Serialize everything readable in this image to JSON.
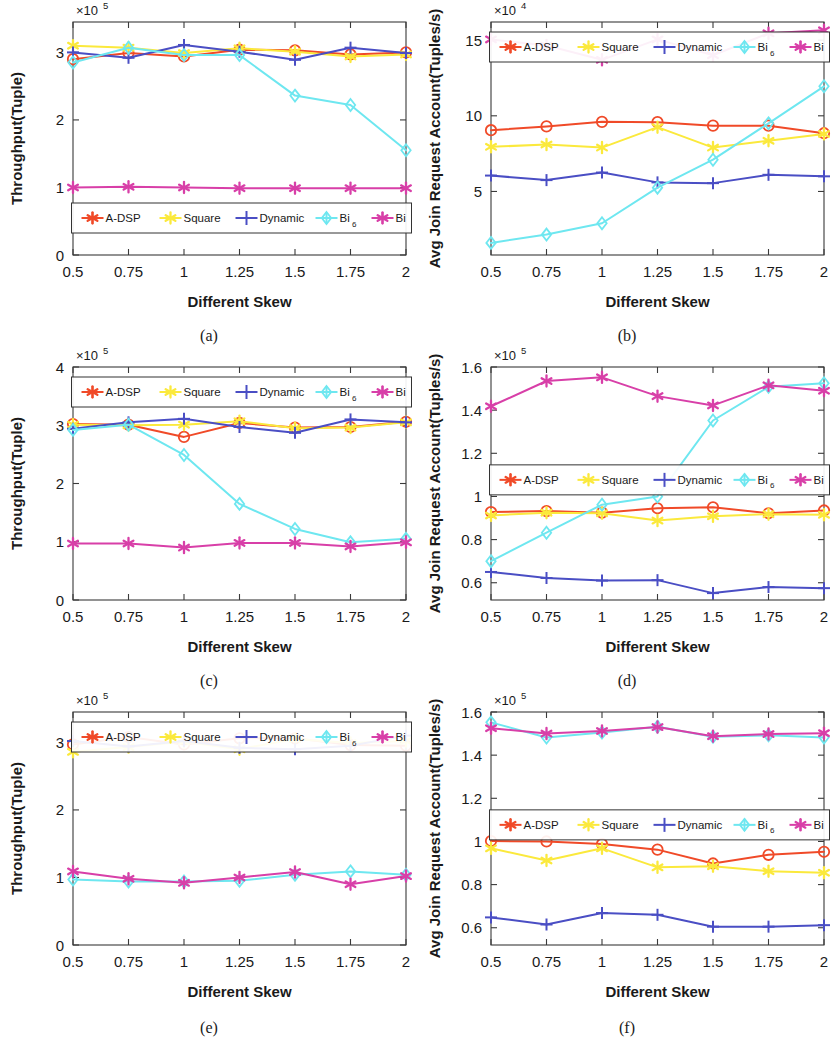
{
  "figure": {
    "xlabel": "Different  Skew",
    "categories": [
      "0.5",
      "0.75",
      "1",
      "1.25",
      "1.5",
      "1.75",
      "2"
    ],
    "series_names": [
      "A-DSP",
      "Square",
      "Dynamic",
      "Bi",
      "Bi"
    ],
    "legend_labels": [
      "A-DSP",
      "Square",
      "Dynamic",
      "Bi",
      "Bi"
    ],
    "legend_sub": "6",
    "colors": {
      "A-DSP": "#f04a28",
      "Square": "#fbe93c",
      "Dynamic": "#4a4ec4",
      "Bi6": "#6ee7f0",
      "Bi": "#d83fa8"
    },
    "captions": [
      "(a)",
      "(b)",
      "(c)",
      "(d)",
      "(e)",
      "(f)"
    ]
  },
  "chart_data": [
    {
      "type": "line",
      "panel": "(a)",
      "title": "",
      "xlabel": "Different  Skew",
      "ylabel": "Throughput(Tuple)",
      "y_exponent": "×10",
      "y_exponent_sup": "5",
      "x": [
        0.5,
        0.75,
        1,
        1.25,
        1.5,
        1.75,
        2
      ],
      "xticklabels": [
        "0.5",
        "0.75",
        "1",
        "1.25",
        "1.5",
        "1.75",
        "2"
      ],
      "ylim": [
        0,
        3.45
      ],
      "yticks": [
        0,
        1,
        2,
        3
      ],
      "yticklabels": [
        "0",
        "1",
        "2",
        "3"
      ],
      "grid": false,
      "legend_position": "lower-center",
      "series": [
        {
          "name": "A-DSP",
          "values": [
            2.9,
            2.99,
            2.94,
            3.04,
            3.03,
            2.97,
            3.0
          ]
        },
        {
          "name": "Square",
          "values": [
            3.1,
            3.07,
            2.99,
            3.06,
            3.01,
            2.94,
            2.97
          ]
        },
        {
          "name": "Dynamic",
          "values": [
            3.0,
            2.92,
            3.11,
            3.01,
            2.89,
            3.07,
            2.99
          ]
        },
        {
          "name": "Bi6",
          "values": [
            2.85,
            3.07,
            2.96,
            2.96,
            2.36,
            2.22,
            1.55
          ]
        },
        {
          "name": "Bi",
          "values": [
            1.0,
            1.01,
            1.0,
            0.99,
            0.99,
            0.99,
            0.99
          ]
        }
      ]
    },
    {
      "type": "line",
      "panel": "(b)",
      "title": "",
      "xlabel": "Different  Skew",
      "ylabel": "Avg Join Request Account(Tuples/s)",
      "y_exponent": "×10",
      "y_exponent_sup": "4",
      "x": [
        0.5,
        0.75,
        1,
        1.25,
        1.5,
        1.75,
        2
      ],
      "xticklabels": [
        "0.5",
        "0.75",
        "1",
        "1.25",
        "1.5",
        "1.75",
        "2"
      ],
      "ylim": [
        0.8,
        16.2
      ],
      "yticks": [
        5,
        10,
        15
      ],
      "yticklabels": [
        "5",
        "10",
        "15"
      ],
      "grid": false,
      "legend_position": "upper-center",
      "series": [
        {
          "name": "A-DSP",
          "values": [
            9.05,
            9.3,
            9.6,
            9.58,
            9.35,
            9.35,
            8.85
          ]
        },
        {
          "name": "Square",
          "values": [
            7.95,
            8.1,
            7.9,
            9.25,
            7.9,
            8.35,
            8.8
          ]
        },
        {
          "name": "Dynamic",
          "values": [
            6.05,
            5.75,
            6.25,
            5.6,
            5.55,
            6.1,
            6.0
          ]
        },
        {
          "name": "Bi6",
          "values": [
            1.6,
            2.15,
            2.9,
            5.25,
            7.1,
            9.5,
            11.95
          ]
        },
        {
          "name": "Bi",
          "values": [
            15.05,
            14.65,
            13.7,
            15.05,
            14.0,
            15.45,
            15.65
          ]
        }
      ]
    },
    {
      "type": "line",
      "panel": "(c)",
      "title": "",
      "xlabel": "Different  Skew",
      "ylabel": "Throughput(Tuple)",
      "y_exponent": "×10",
      "y_exponent_sup": "5",
      "x": [
        0.5,
        0.75,
        1,
        1.25,
        1.5,
        1.75,
        2
      ],
      "xticklabels": [
        "0.5",
        "0.75",
        "1",
        "1.25",
        "1.5",
        "1.75",
        "2"
      ],
      "ylim": [
        0,
        4
      ],
      "yticks": [
        0,
        1,
        2,
        3,
        4
      ],
      "yticklabels": [
        "0",
        "1",
        "2",
        "3",
        "4"
      ],
      "grid": false,
      "legend_position": "upper-center",
      "series": [
        {
          "name": "A-DSP",
          "values": [
            3.02,
            3.01,
            2.8,
            3.04,
            2.96,
            2.97,
            3.06
          ]
        },
        {
          "name": "Square",
          "values": [
            3.01,
            3.0,
            3.01,
            3.07,
            2.95,
            2.96,
            3.05
          ]
        },
        {
          "name": "Dynamic",
          "values": [
            2.94,
            3.05,
            3.11,
            2.97,
            2.87,
            3.1,
            3.05
          ]
        },
        {
          "name": "Bi6",
          "values": [
            2.92,
            3.01,
            2.49,
            1.65,
            1.22,
            0.99,
            1.05
          ]
        },
        {
          "name": "Bi",
          "values": [
            0.97,
            0.97,
            0.9,
            0.98,
            0.98,
            0.92,
            0.99
          ]
        }
      ]
    },
    {
      "type": "line",
      "panel": "(d)",
      "title": "",
      "xlabel": "Different  Skew",
      "ylabel": "Avg Join Request Account(Tuples/s)",
      "y_exponent": "×10",
      "y_exponent_sup": "5",
      "x": [
        0.5,
        0.75,
        1,
        1.25,
        1.5,
        1.75,
        2
      ],
      "xticklabels": [
        "0.5",
        "0.75",
        "1",
        "1.25",
        "1.5",
        "1.75",
        "2"
      ],
      "ylim": [
        0.52,
        1.6
      ],
      "yticks": [
        0.6,
        0.8,
        1,
        1.2,
        1.4,
        1.6
      ],
      "yticklabels": [
        "0.6",
        "0.8",
        "1",
        "1.2",
        "1.4",
        "1.6"
      ],
      "grid": false,
      "legend_position": "middle-center",
      "series": [
        {
          "name": "A-DSP",
          "values": [
            0.928,
            0.932,
            0.925,
            0.945,
            0.95,
            0.922,
            0.935
          ]
        },
        {
          "name": "Square",
          "values": [
            0.912,
            0.925,
            0.922,
            0.888,
            0.908,
            0.918,
            0.915
          ]
        },
        {
          "name": "Dynamic",
          "values": [
            0.65,
            0.622,
            0.61,
            0.612,
            0.552,
            0.58,
            0.575
          ]
        },
        {
          "name": "Bi6",
          "values": [
            0.7,
            0.832,
            0.962,
            1.0,
            1.352,
            1.508,
            1.525
          ]
        },
        {
          "name": "Bi",
          "values": [
            1.418,
            1.535,
            1.552,
            1.465,
            1.422,
            1.515,
            1.49
          ]
        }
      ]
    },
    {
      "type": "line",
      "panel": "(e)",
      "title": "",
      "xlabel": "Different  Skew",
      "ylabel": "Throughput(Tuple)",
      "y_exponent": "×10",
      "y_exponent_sup": "5",
      "x": [
        0.5,
        0.75,
        1,
        1.25,
        1.5,
        1.75,
        2
      ],
      "xticklabels": [
        "0.5",
        "0.75",
        "1",
        "1.25",
        "1.5",
        "1.75",
        "2"
      ],
      "ylim": [
        0,
        3.45
      ],
      "yticks": [
        0,
        1,
        2,
        3
      ],
      "yticklabels": [
        "0",
        "1",
        "2",
        "3"
      ],
      "grid": false,
      "legend_position": "upper-center",
      "series": [
        {
          "name": "A-DSP",
          "values": [
            2.97,
            3.08,
            2.97,
            3.06,
            3.06,
            2.96,
            2.95
          ]
        },
        {
          "name": "Square",
          "values": [
            2.86,
            2.93,
            3.01,
            2.9,
            3.05,
            2.99,
            3.02
          ]
        },
        {
          "name": "Dynamic",
          "values": [
            3.02,
            2.94,
            3.02,
            2.92,
            2.9,
            2.95,
            3.1
          ]
        },
        {
          "name": "Bi6",
          "values": [
            0.97,
            0.94,
            0.94,
            0.95,
            1.04,
            1.09,
            1.04
          ]
        },
        {
          "name": "Bi",
          "values": [
            1.09,
            0.98,
            0.92,
            1.0,
            1.08,
            0.9,
            1.02
          ]
        }
      ]
    },
    {
      "type": "line",
      "panel": "(f)",
      "title": "",
      "xlabel": "Different  Skew",
      "ylabel": "Avg Join Request Account(Tuples/s)",
      "y_exponent": "×10",
      "y_exponent_sup": "5",
      "x": [
        0.5,
        0.75,
        1,
        1.25,
        1.5,
        1.75,
        2
      ],
      "xticklabels": [
        "0.5",
        "0.75",
        "1",
        "1.25",
        "1.5",
        "1.75",
        "2"
      ],
      "ylim": [
        0.52,
        1.6
      ],
      "yticks": [
        0.6,
        0.8,
        1,
        1.2,
        1.4,
        1.6
      ],
      "yticklabels": [
        "0.6",
        "0.8",
        "1",
        "1.2",
        "1.4",
        "1.6"
      ],
      "grid": false,
      "legend_position": "middle-center",
      "series": [
        {
          "name": "A-DSP",
          "values": [
            1.002,
            1.0,
            0.988,
            0.962,
            0.898,
            0.938,
            0.952
          ]
        },
        {
          "name": "Square",
          "values": [
            0.968,
            0.912,
            0.968,
            0.88,
            0.885,
            0.862,
            0.855
          ]
        },
        {
          "name": "Dynamic",
          "values": [
            0.648,
            0.615,
            0.668,
            0.66,
            0.605,
            0.605,
            0.612
          ]
        },
        {
          "name": "Bi6",
          "values": [
            1.552,
            1.482,
            1.505,
            1.532,
            1.485,
            1.492,
            1.482
          ]
        },
        {
          "name": "Bi",
          "values": [
            1.525,
            1.5,
            1.512,
            1.53,
            1.488,
            1.498,
            1.502
          ]
        }
      ]
    }
  ]
}
